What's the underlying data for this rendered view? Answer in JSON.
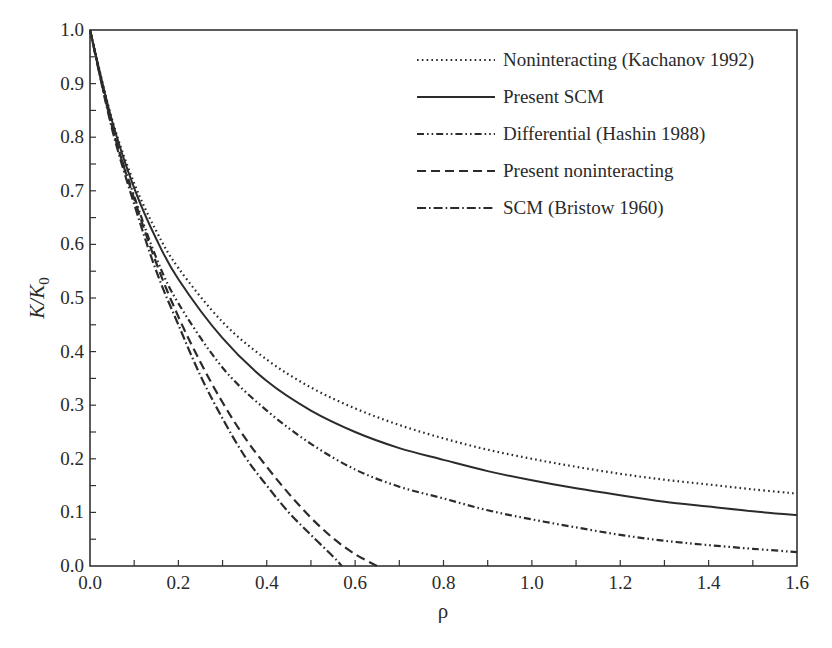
{
  "chart_data": {
    "type": "line",
    "title": "",
    "xlabel": "ρ",
    "ylabel": "K/K",
    "ylabel_subscript": "0",
    "xlim": [
      0.0,
      1.6
    ],
    "ylim": [
      0.0,
      1.0
    ],
    "x_ticks": [
      "0.0",
      "0.2",
      "0.4",
      "0.6",
      "0.8",
      "1.0",
      "1.2",
      "1.4",
      "1.6"
    ],
    "y_ticks": [
      "0.0",
      "0.1",
      "0.2",
      "0.3",
      "0.4",
      "0.5",
      "0.6",
      "0.7",
      "0.8",
      "0.9",
      "1.0"
    ],
    "grid": false,
    "legend_position": "upper right",
    "series": [
      {
        "name": "Noninteracting (Kachanov 1992)",
        "style": "dotted",
        "x": [
          0,
          0.05,
          0.1,
          0.15,
          0.2,
          0.3,
          0.4,
          0.5,
          0.6,
          0.7,
          0.8,
          0.9,
          1.0,
          1.1,
          1.2,
          1.3,
          1.4,
          1.5,
          1.6
        ],
        "y": [
          1.0,
          0.833,
          0.714,
          0.625,
          0.556,
          0.455,
          0.385,
          0.333,
          0.294,
          0.263,
          0.238,
          0.217,
          0.2,
          0.185,
          0.172,
          0.161,
          0.152,
          0.143,
          0.135
        ]
      },
      {
        "name": "Present SCM",
        "style": "solid",
        "x": [
          0,
          0.05,
          0.1,
          0.15,
          0.2,
          0.3,
          0.4,
          0.5,
          0.6,
          0.7,
          0.8,
          0.9,
          1.0,
          1.1,
          1.2,
          1.3,
          1.4,
          1.5,
          1.6
        ],
        "y": [
          1.0,
          0.83,
          0.705,
          0.61,
          0.535,
          0.425,
          0.345,
          0.29,
          0.25,
          0.22,
          0.198,
          0.177,
          0.16,
          0.145,
          0.132,
          0.12,
          0.111,
          0.102,
          0.095
        ]
      },
      {
        "name": "Differential (Hashin 1988)",
        "style": "dash-dot-dot",
        "x": [
          0,
          0.05,
          0.1,
          0.15,
          0.2,
          0.3,
          0.4,
          0.5,
          0.6,
          0.7,
          0.8,
          0.9,
          1.0,
          1.1,
          1.2,
          1.3,
          1.4,
          1.5,
          1.6
        ],
        "y": [
          1.0,
          0.82,
          0.69,
          0.575,
          0.49,
          0.37,
          0.29,
          0.228,
          0.18,
          0.148,
          0.126,
          0.104,
          0.087,
          0.072,
          0.058,
          0.047,
          0.039,
          0.032,
          0.026
        ]
      },
      {
        "name": "Present noninteracting",
        "style": "dashed",
        "x": [
          0,
          0.05,
          0.1,
          0.15,
          0.2,
          0.25,
          0.3,
          0.35,
          0.4,
          0.45,
          0.5,
          0.55,
          0.6,
          0.65
        ],
        "y": [
          1.0,
          0.82,
          0.685,
          0.565,
          0.465,
          0.38,
          0.305,
          0.24,
          0.185,
          0.135,
          0.09,
          0.052,
          0.022,
          0.0
        ]
      },
      {
        "name": "SCM (Bristow 1960)",
        "style": "dash-dot",
        "x": [
          0,
          0.05,
          0.1,
          0.15,
          0.2,
          0.25,
          0.3,
          0.35,
          0.4,
          0.45,
          0.5,
          0.55,
          0.57
        ],
        "y": [
          1.0,
          0.815,
          0.675,
          0.55,
          0.45,
          0.355,
          0.275,
          0.205,
          0.15,
          0.1,
          0.058,
          0.018,
          0.0
        ]
      }
    ]
  }
}
